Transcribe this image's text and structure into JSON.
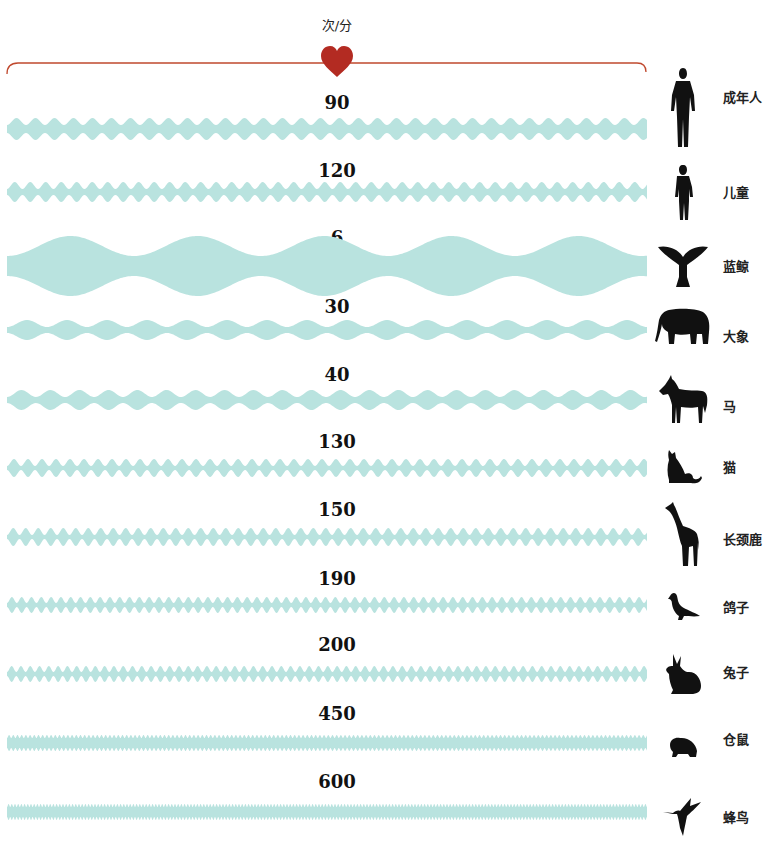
{
  "header": {
    "unit": "次/分",
    "heart_icon": "heart-icon",
    "bracket_color": "#C0492E",
    "heart_color": "#B32B22"
  },
  "wave_color": "#B9E3DF",
  "rows": [
    {
      "rate": "90",
      "name": "成年人",
      "icon": "adult-human-icon",
      "wave_y": 129,
      "amp_max": 11,
      "amp_min": 4,
      "period": 19,
      "label_y": 92,
      "icon_y": 68,
      "icon_h": 80,
      "name_y": 87
    },
    {
      "rate": "120",
      "name": "儿童",
      "icon": "child-icon",
      "wave_y": 192,
      "amp_max": 10,
      "amp_min": 3,
      "period": 15.5,
      "label_y": 160,
      "icon_y": 165,
      "icon_h": 56,
      "name_y": 182
    },
    {
      "rate": "6",
      "name": "蓝鲸",
      "icon": "whale-tail-icon",
      "wave_y": 266,
      "amp_max": 30,
      "amp_min": 10,
      "period": 127,
      "label_y": 227,
      "icon_y": 243,
      "icon_h": 44,
      "name_y": 256
    },
    {
      "rate": "30",
      "name": "大象",
      "icon": "elephant-icon",
      "wave_y": 330,
      "amp_max": 10,
      "amp_min": 3,
      "period": 40,
      "label_y": 296,
      "icon_y": 308,
      "icon_h": 38,
      "name_y": 326
    },
    {
      "rate": "40",
      "name": "马",
      "icon": "horse-icon",
      "wave_y": 400,
      "amp_max": 10,
      "amp_min": 3,
      "period": 29,
      "label_y": 364,
      "icon_y": 375,
      "icon_h": 50,
      "name_y": 396
    },
    {
      "rate": "130",
      "name": "猫",
      "icon": "cat-icon",
      "wave_y": 468,
      "amp_max": 9,
      "amp_min": 2,
      "period": 14,
      "label_y": 431,
      "icon_y": 450,
      "icon_h": 35,
      "name_y": 457
    },
    {
      "rate": "150",
      "name": "长颈鹿",
      "icon": "giraffe-icon",
      "wave_y": 537,
      "amp_max": 9,
      "amp_min": 2,
      "period": 12.5,
      "label_y": 499,
      "icon_y": 502,
      "icon_h": 65,
      "name_y": 529
    },
    {
      "rate": "190",
      "name": "鸽子",
      "icon": "pigeon-icon",
      "wave_y": 605,
      "amp_max": 8,
      "amp_min": 2,
      "period": 9.8,
      "label_y": 568,
      "icon_y": 592,
      "icon_h": 30,
      "name_y": 597
    },
    {
      "rate": "200",
      "name": "兔子",
      "icon": "rabbit-icon",
      "wave_y": 674,
      "amp_max": 8,
      "amp_min": 2,
      "period": 9.3,
      "label_y": 634,
      "icon_y": 654,
      "icon_h": 40,
      "name_y": 662
    },
    {
      "rate": "450",
      "name": "仓鼠",
      "icon": "hamster-icon",
      "wave_y": 743,
      "amp_max": 8,
      "amp_min": 5,
      "period": 4.2,
      "label_y": 703,
      "icon_y": 735,
      "icon_h": 22,
      "name_y": 729
    },
    {
      "rate": "600",
      "name": "蜂鸟",
      "icon": "hummingbird-icon",
      "wave_y": 812,
      "amp_max": 8,
      "amp_min": 5,
      "period": 3.2,
      "label_y": 771,
      "icon_y": 798,
      "icon_h": 38,
      "name_y": 807
    }
  ],
  "chart_data": {
    "type": "bar",
    "xlabel": "",
    "ylabel": "心率 (次/分)",
    "categories": [
      "成年人",
      "儿童",
      "蓝鲸",
      "大象",
      "马",
      "猫",
      "长颈鹿",
      "鸽子",
      "兔子",
      "仓鼠",
      "蜂鸟"
    ],
    "values": [
      90,
      120,
      6,
      30,
      40,
      130,
      150,
      190,
      200,
      450,
      600
    ],
    "annotations": [
      "heart icon at top center",
      "each row drawn as a heartbeat waveform whose frequency reflects the rate"
    ]
  }
}
